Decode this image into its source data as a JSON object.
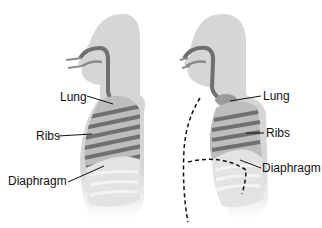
{
  "diagram": {
    "title": "",
    "panels": [
      {
        "id": "left",
        "state": "inhale",
        "labels": [
          {
            "text": "Lung"
          },
          {
            "text": "Ribs"
          },
          {
            "text": "Diaphragm"
          }
        ]
      },
      {
        "id": "right",
        "state": "exhale",
        "labels": [
          {
            "text": "Lung"
          },
          {
            "text": "Ribs"
          },
          {
            "text": "Diaphragm"
          }
        ]
      }
    ],
    "colors": {
      "body": "#d9d9d9",
      "body_dark": "#c8c8c8",
      "airway": "#6f6f6f",
      "lung_light": "#bdbdbd",
      "rib_dark": "#707070",
      "abdomen": "#e6e6e6",
      "leader": "#111111"
    }
  }
}
